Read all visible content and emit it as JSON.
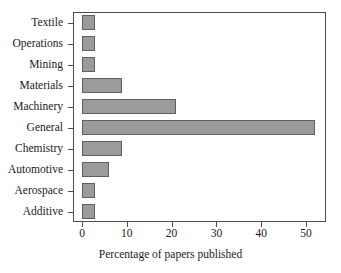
{
  "chart_data": {
    "type": "bar",
    "orientation": "horizontal",
    "title": "",
    "xlabel": "Percentage of papers published",
    "ylabel": "",
    "categories": [
      "Textile",
      "Operations",
      "Mining",
      "Materials",
      "Machinery",
      "General",
      "Chemistry",
      "Automotive",
      "Aerospace",
      "Additive"
    ],
    "values": [
      3,
      3,
      3,
      9,
      21,
      52,
      9,
      6,
      3,
      3
    ],
    "xlim": [
      0,
      56
    ],
    "ylim": [
      0,
      10
    ],
    "xticks": [
      0,
      10,
      20,
      30,
      40,
      50
    ],
    "xticklabels": [
      "0",
      "10",
      "20",
      "30",
      "40",
      "50"
    ],
    "grid": false,
    "legend": null,
    "bar_fill_color": "#9a9b9b",
    "bar_edge_color": "#5e5f5f",
    "axis_color": "#4d4d4d",
    "background_color": "#ffffff"
  }
}
